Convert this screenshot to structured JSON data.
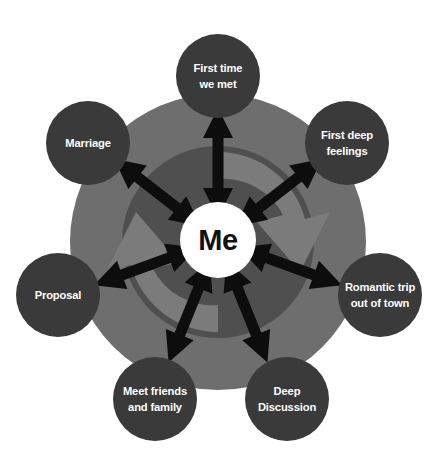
{
  "diagram": {
    "type": "radial-hub-and-spoke",
    "title_visible": false,
    "background_color": "#ffffff",
    "center": {
      "label": "Me",
      "text_color": "#111111",
      "fill_color": "#ffffff",
      "cx": 218,
      "cy": 240,
      "r": 38
    },
    "rings": [
      {
        "name": "outer-ring",
        "fill_color": "#6e6e6e",
        "cx": 218,
        "cy": 242,
        "r": 148
      },
      {
        "name": "inner-ring",
        "fill_color": "#4f4f4f",
        "cx": 218,
        "cy": 242,
        "r": 96
      }
    ],
    "swoosh": {
      "name": "circular-rotation-arrow",
      "fill_color": "#7b7b7b"
    },
    "connector": {
      "name": "double-headed-arrow",
      "color": "#0d0d0d",
      "count": 7
    },
    "node_style": {
      "fill_color": "#3a3a3a",
      "text_color": "#ffffff",
      "radius": 42
    },
    "nodes": [
      {
        "id": "first-time-we-met",
        "label": "First time we met",
        "lines": [
          "First time",
          "we met"
        ],
        "cx": 218,
        "cy": 76,
        "angle_deg": 90
      },
      {
        "id": "first-deep-feelings",
        "label": "First deep feelings",
        "lines": [
          "First deep",
          "feelings"
        ],
        "cx": 347,
        "cy": 143,
        "angle_deg": 38
      },
      {
        "id": "romantic-trip-out-of-town",
        "label": "Romantic trip out of town",
        "lines": [
          "Romantic trip",
          "out of town"
        ],
        "cx": 380,
        "cy": 295,
        "angle_deg": -20
      },
      {
        "id": "deep-discussion",
        "label": "Deep Discussion",
        "lines": [
          "Deep",
          "Discussion"
        ],
        "cx": 287,
        "cy": 399,
        "angle_deg": -68
      },
      {
        "id": "meet-friends-and-family",
        "label": "Meet friends and family",
        "lines": [
          "Meet friends",
          "and family"
        ],
        "cx": 155,
        "cy": 399,
        "angle_deg": -112
      },
      {
        "id": "proposal",
        "label": "Proposal",
        "lines": [
          "Proposal"
        ],
        "cx": 58,
        "cy": 295,
        "angle_deg": 200
      },
      {
        "id": "marriage",
        "label": "Marriage",
        "lines": [
          "Marriage"
        ],
        "cx": 88,
        "cy": 143,
        "angle_deg": 142
      }
    ]
  }
}
